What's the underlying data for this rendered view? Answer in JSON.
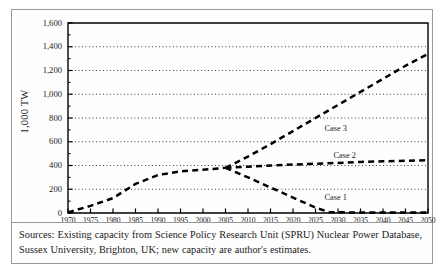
{
  "figure": {
    "caption": "Sources: Existing capacity from Science Policy Research Unit (SPRU) Nuclear Power Database, Sussex University, Brighton, UK; new capacity are author's estimates."
  },
  "chart_data": {
    "type": "line",
    "title": "",
    "xlabel": "",
    "ylabel": "1,000 TW",
    "xlim": [
      1970,
      2050
    ],
    "ylim": [
      0,
      1600
    ],
    "grid": true,
    "legend_position": "inline-annotations",
    "xticks": [
      1970,
      1975,
      1980,
      1985,
      1990,
      1995,
      2000,
      2005,
      2010,
      2015,
      2020,
      2025,
      2030,
      2035,
      2040,
      2045,
      2050
    ],
    "xtick_labels": [
      "1970",
      "1975",
      "1980",
      "1985",
      "1990",
      "1995",
      "2000",
      "2005",
      "2010",
      "2015",
      "2020",
      "2025",
      "2030",
      "2035",
      "2040",
      "2045",
      "2050"
    ],
    "yticks": [
      0,
      200,
      400,
      600,
      800,
      1000,
      1200,
      1400,
      1600
    ],
    "ytick_labels": [
      "0",
      "200",
      "400",
      "600",
      "800",
      "1,000",
      "1,200",
      "1,400",
      "1,600"
    ],
    "series": [
      {
        "name": "Existing capacity",
        "style": "dashed",
        "x": [
          1970,
          1975,
          1980,
          1985,
          1990,
          1995,
          2000,
          2005
        ],
        "values": [
          5,
          60,
          125,
          245,
          320,
          350,
          365,
          380
        ]
      },
      {
        "name": "Case 1",
        "style": "dashed",
        "x": [
          2005,
          2010,
          2015,
          2020,
          2025,
          2028,
          2032,
          2036,
          2040,
          2045,
          2050
        ],
        "values": [
          380,
          300,
          215,
          130,
          45,
          8,
          5,
          5,
          5,
          5,
          5
        ]
      },
      {
        "name": "Case 2",
        "style": "dashed",
        "x": [
          2005,
          2010,
          2015,
          2020,
          2025,
          2030,
          2035,
          2040,
          2045,
          2050
        ],
        "values": [
          380,
          390,
          400,
          408,
          415,
          422,
          430,
          435,
          440,
          445
        ]
      },
      {
        "name": "Case 3",
        "style": "dashed",
        "x": [
          2005,
          2010,
          2015,
          2020,
          2025,
          2030,
          2035,
          2040,
          2045,
          2050
        ],
        "values": [
          380,
          475,
          580,
          690,
          800,
          910,
          1020,
          1130,
          1240,
          1340
        ]
      }
    ],
    "annotations": [
      {
        "text": "Case 3",
        "x": 2027,
        "y": 700
      },
      {
        "text": "Case 2",
        "x": 2029,
        "y": 470
      },
      {
        "text": "Case 1",
        "x": 2027,
        "y": 120
      }
    ]
  }
}
